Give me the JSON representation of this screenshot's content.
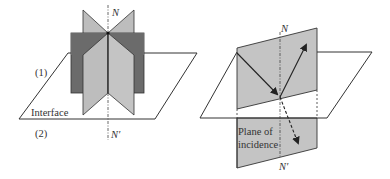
{
  "figure": {
    "left_panel": {
      "labels": {
        "normal_top": "N",
        "normal_bottom": "N′",
        "medium_1": "(1)",
        "medium_2": "(2)",
        "interface": "Interface"
      }
    },
    "right_panel": {
      "labels": {
        "normal_top": "N",
        "normal_bottom": "N′",
        "plane_line1": "Plane of",
        "plane_line2": "incidence"
      }
    },
    "colors": {
      "dark_plane": "#6b6b6b",
      "light_plane": "#bdbdbd",
      "plane_of_incidence": "#c4c4c4",
      "stroke": "#333333",
      "background": "#ffffff"
    }
  }
}
